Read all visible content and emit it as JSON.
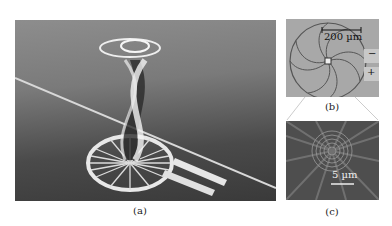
{
  "figure": {
    "panels": [
      {
        "id": "a",
        "caption": "(a)",
        "description": "3D rendering of spiral-spoke microring emitter on waveguide with twisted light beam"
      },
      {
        "id": "b",
        "caption": "(b)",
        "scale_bar": "200 µm",
        "electrode_labels": [
          "−",
          "+"
        ]
      },
      {
        "id": "c",
        "caption": "(c)",
        "scale_bar": "5 µm"
      }
    ]
  }
}
